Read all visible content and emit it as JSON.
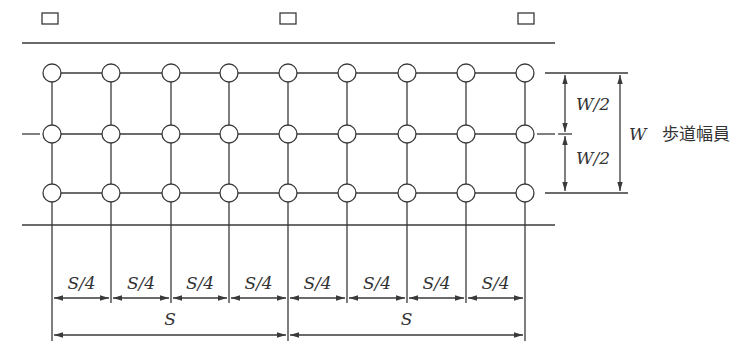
{
  "diagram": {
    "grid": {
      "columns_x": [
        52,
        111,
        171,
        229,
        288,
        347,
        407,
        466,
        525
      ],
      "rows_y": [
        73,
        134,
        193
      ],
      "node_radius": 9
    },
    "lamps_x": [
      49,
      287,
      525
    ],
    "labels": {
      "half_width_top": "W/2",
      "half_width_bottom": "W/2",
      "width": "W",
      "width_name": "歩道幅員",
      "quarter_span": "S/4",
      "span": "S"
    },
    "quarter_spans": [
      "S/4",
      "S/4",
      "S/4",
      "S/4",
      "S/4",
      "S/4",
      "S/4",
      "S/4"
    ],
    "spans": [
      "S",
      "S"
    ],
    "colors": {
      "line": "#3a3a3a",
      "text": "#333333",
      "background": "#ffffff"
    }
  }
}
